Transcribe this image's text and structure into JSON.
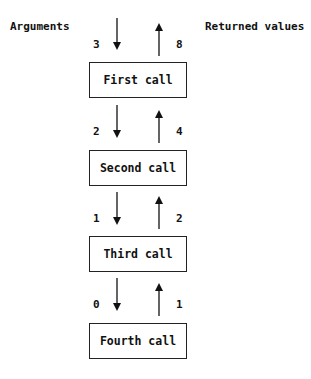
{
  "headers": {
    "arguments": "Arguments",
    "returned": "Returned values"
  },
  "calls": [
    {
      "label": "First call",
      "argument": "3",
      "returned": "8"
    },
    {
      "label": "Second call",
      "argument": "2",
      "returned": "4"
    },
    {
      "label": "Third call",
      "argument": "1",
      "returned": "2"
    },
    {
      "label": "Fourth call",
      "argument": "0",
      "returned": "1"
    }
  ],
  "colors": {
    "line": "#111111",
    "background": "#ffffff"
  }
}
